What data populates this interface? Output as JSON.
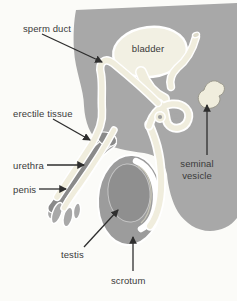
{
  "labels": {
    "sperm_duct": "sperm duct",
    "bladder": "bladder",
    "erectile_tissue": "erectile tissue",
    "urethra": "urethra",
    "penis": "penis",
    "seminal_vesicle": "seminal vesicle",
    "testis": "testis",
    "scrotum": "scrotum"
  },
  "colors": {
    "background": "#fbfbf8",
    "body": "#a8a8a8",
    "scrotum": "#9c9c9c",
    "testis": "#8f8f8f",
    "erectile": "#8a8a8a",
    "duct": "#f0eddd",
    "bladder": "#f2f0e3",
    "outline": "#ffffff",
    "arrow": "#2e2e2e",
    "label_text": "#3a3a3a"
  }
}
